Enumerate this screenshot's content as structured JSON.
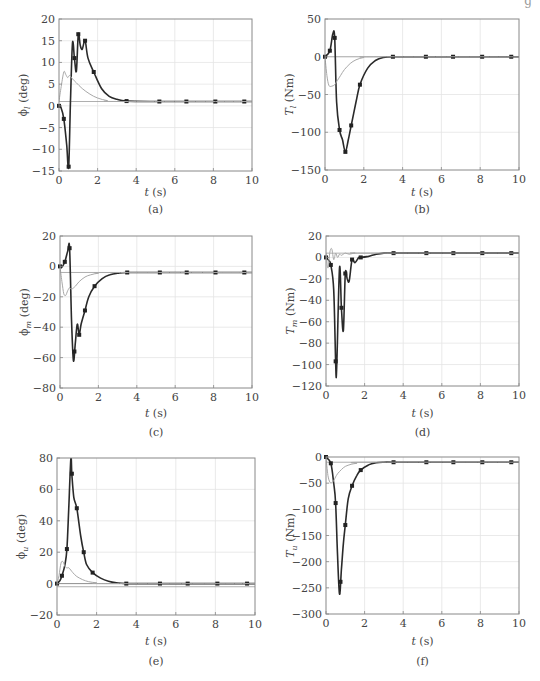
{
  "page": {
    "corner_fragment": "g"
  },
  "chart_data": [
    {
      "id": "a",
      "type": "line",
      "caption": "(a)",
      "ylabel": "ϕ_l (deg)",
      "ylabel_main": "ϕ",
      "ylabel_sub": "l",
      "ylabel_unit": "(deg)",
      "xlabel": "t (s)",
      "xlim": [
        0,
        10
      ],
      "ylim": [
        -15,
        20
      ],
      "xticks": [
        0,
        2,
        4,
        6,
        8,
        10
      ],
      "yticks": [
        -15,
        -10,
        -5,
        0,
        5,
        10,
        15,
        20
      ],
      "grid": true,
      "reference": 1,
      "series": [
        {
          "name": "thick-marked",
          "style": "thick",
          "markers": true,
          "x": [
            0,
            0.1,
            0.25,
            0.4,
            0.5,
            0.6,
            0.7,
            0.8,
            0.9,
            1.0,
            1.1,
            1.2,
            1.35,
            1.5,
            1.8,
            2.2,
            2.6,
            3.0,
            3.5,
            5.2,
            6.6,
            8.1,
            9.6,
            10
          ],
          "y": [
            0,
            -0.3,
            -3,
            -9,
            -14,
            2,
            14.5,
            11,
            8,
            16.5,
            14,
            13,
            15,
            11,
            7.8,
            4,
            2.2,
            1.5,
            1.1,
            1,
            1,
            1,
            1,
            1
          ],
          "marker_x": [
            0,
            0.25,
            0.5,
            0.8,
            1.0,
            1.35,
            1.8,
            3.5,
            5.2,
            6.6,
            8.1,
            9.6
          ]
        },
        {
          "name": "thin-gray",
          "style": "thin",
          "x": [
            0,
            0.1,
            0.25,
            0.35,
            0.45,
            0.55,
            0.7,
            0.9,
            1.2,
            1.6,
            2.0,
            2.5,
            3.0,
            10
          ],
          "y": [
            1,
            4,
            7.8,
            7.2,
            6.5,
            7,
            6.2,
            5.3,
            4,
            2.7,
            1.8,
            1.2,
            1,
            1
          ]
        }
      ]
    },
    {
      "id": "b",
      "type": "line",
      "caption": "(b)",
      "ylabel": "T_l (Nm)",
      "ylabel_main": "T",
      "ylabel_sub": "l",
      "ylabel_unit": "(Nm)",
      "xlabel": "t (s)",
      "xlim": [
        0,
        10
      ],
      "ylim": [
        -150,
        50
      ],
      "xticks": [
        0,
        2,
        4,
        6,
        8,
        10
      ],
      "yticks": [
        -150,
        -100,
        -50,
        0,
        50
      ],
      "grid": true,
      "reference": 0,
      "series": [
        {
          "name": "thick-marked",
          "style": "thick",
          "markers": true,
          "x": [
            0,
            0.25,
            0.4,
            0.5,
            0.6,
            0.75,
            0.9,
            1.05,
            1.2,
            1.35,
            1.6,
            1.8,
            2.2,
            2.6,
            3.0,
            3.5,
            5.2,
            6.6,
            8.1,
            9.6,
            10
          ],
          "y": [
            0,
            8,
            30,
            25,
            -60,
            -97,
            -110,
            -126,
            -110,
            -91,
            -60,
            -37,
            -15,
            -5,
            -1,
            0,
            0,
            0,
            0,
            0,
            0
          ],
          "marker_x": [
            0,
            0.25,
            0.5,
            0.75,
            1.05,
            1.35,
            1.8,
            3.5,
            5.2,
            6.6,
            8.1,
            9.6
          ]
        },
        {
          "name": "thin-gray",
          "style": "thin",
          "x": [
            0,
            0.1,
            0.2,
            0.35,
            0.5,
            0.6,
            0.8,
            1.0,
            1.3,
            1.6,
            2.0,
            2.5,
            10
          ],
          "y": [
            0,
            -25,
            -38,
            -39,
            -37,
            -33,
            -25,
            -17,
            -9,
            -4,
            -1,
            0,
            0
          ]
        }
      ]
    },
    {
      "id": "c",
      "type": "line",
      "caption": "(c)",
      "ylabel": "ϕ_m (deg)",
      "ylabel_main": "ϕ",
      "ylabel_sub": "m",
      "ylabel_unit": "(deg)",
      "xlabel": "t (s)",
      "xlim": [
        0,
        10
      ],
      "ylim": [
        -80,
        20
      ],
      "xticks": [
        0,
        2,
        4,
        6,
        8,
        10
      ],
      "yticks": [
        -80,
        -60,
        -40,
        -20,
        0,
        20
      ],
      "grid": true,
      "reference": -4,
      "series": [
        {
          "name": "thick-marked",
          "style": "thick",
          "markers": true,
          "x": [
            0,
            0.1,
            0.25,
            0.4,
            0.5,
            0.6,
            0.7,
            0.8,
            0.9,
            1.0,
            1.1,
            1.3,
            1.5,
            1.8,
            2.2,
            2.6,
            3.0,
            3.5,
            5.2,
            6.6,
            8.1,
            9.6,
            10
          ],
          "y": [
            0,
            -0.5,
            3,
            10,
            12,
            -35,
            -62,
            -50,
            -38,
            -45,
            -38,
            -29,
            -20,
            -13,
            -8,
            -5.5,
            -4.5,
            -4,
            -4,
            -4,
            -4,
            -4,
            -4
          ],
          "marker_x": [
            0,
            0.25,
            0.5,
            0.75,
            1.0,
            1.3,
            1.8,
            3.5,
            5.2,
            6.6,
            8.1,
            9.6
          ]
        },
        {
          "name": "thin-gray",
          "style": "thin",
          "x": [
            0,
            0.1,
            0.2,
            0.3,
            0.4,
            0.5,
            0.6,
            0.8,
            1.0,
            1.3,
            1.6,
            2.0,
            2.5,
            10
          ],
          "y": [
            0,
            -10,
            -18,
            -19,
            -16,
            -14,
            -15,
            -13,
            -10,
            -7,
            -5.5,
            -4.5,
            -4,
            -4
          ]
        }
      ]
    },
    {
      "id": "d",
      "type": "line",
      "caption": "(d)",
      "ylabel": "T_m (Nm)",
      "ylabel_main": "T",
      "ylabel_sub": "m",
      "ylabel_unit": "(Nm)",
      "xlabel": "t (s)",
      "xlim": [
        0,
        10
      ],
      "ylim": [
        -120,
        20
      ],
      "xticks": [
        0,
        2,
        4,
        6,
        8,
        10
      ],
      "yticks": [
        -120,
        -100,
        -80,
        -60,
        -40,
        -20,
        0,
        20
      ],
      "grid": true,
      "reference": 4,
      "series": [
        {
          "name": "thick-marked",
          "style": "thick",
          "markers": true,
          "x": [
            0,
            0.15,
            0.25,
            0.4,
            0.5,
            0.55,
            0.7,
            0.8,
            0.9,
            1.0,
            1.1,
            1.2,
            1.35,
            1.5,
            1.7,
            1.8,
            2.2,
            2.6,
            3.0,
            3.5,
            5.2,
            6.6,
            8.1,
            9.6,
            10
          ],
          "y": [
            0,
            -3,
            -7,
            -30,
            -97,
            -105,
            -10,
            -47,
            -68,
            -15,
            -20,
            -22,
            -2,
            -5,
            0,
            0,
            1,
            3,
            4,
            4,
            4,
            4,
            4,
            4,
            4
          ],
          "marker_x": [
            0,
            0.25,
            0.5,
            0.8,
            1.0,
            1.35,
            1.8,
            3.5,
            5.2,
            6.6,
            8.1,
            9.6
          ]
        },
        {
          "name": "thin-gray",
          "style": "thin",
          "x": [
            0,
            0.1,
            0.2,
            0.3,
            0.4,
            0.5,
            0.6,
            0.7,
            0.8,
            1.0,
            1.2,
            1.5,
            2.0,
            10
          ],
          "y": [
            4,
            -10,
            5,
            8,
            -2,
            4,
            0,
            3,
            2,
            4,
            3,
            4,
            4,
            4
          ]
        }
      ]
    },
    {
      "id": "e",
      "type": "line",
      "caption": "(e)",
      "ylabel": "ϕ_u (deg)",
      "ylabel_main": "ϕ",
      "ylabel_sub": "u",
      "ylabel_unit": "(deg)",
      "xlabel": "t (s)",
      "xlim": [
        0,
        10
      ],
      "ylim": [
        -20,
        80
      ],
      "xticks": [
        0,
        2,
        4,
        6,
        8,
        10
      ],
      "yticks": [
        -20,
        0,
        20,
        40,
        60,
        80
      ],
      "grid": true,
      "reference": -2,
      "series": [
        {
          "name": "thick-marked",
          "style": "thick",
          "markers": true,
          "x": [
            0,
            0.15,
            0.25,
            0.4,
            0.5,
            0.6,
            0.7,
            0.75,
            0.85,
            1.0,
            1.2,
            1.35,
            1.5,
            1.8,
            2.2,
            2.6,
            3.0,
            3.5,
            5.2,
            6.6,
            8.1,
            9.6,
            10
          ],
          "y": [
            0,
            2,
            5,
            12,
            22,
            50,
            80,
            70,
            55,
            48,
            30,
            20,
            12,
            7,
            3.5,
            1.5,
            0.5,
            0,
            0,
            0,
            0,
            0,
            0
          ],
          "marker_x": [
            0,
            0.25,
            0.5,
            0.75,
            1.0,
            1.35,
            1.8,
            3.5,
            5.2,
            6.6,
            8.1,
            9.6
          ]
        },
        {
          "name": "thin-gray",
          "style": "thin",
          "x": [
            0,
            0.1,
            0.2,
            0.3,
            0.4,
            0.5,
            0.6,
            0.8,
            1.0,
            1.3,
            1.6,
            2.0,
            2.5,
            10
          ],
          "y": [
            0,
            5,
            13,
            14,
            11,
            10,
            10,
            7,
            4.5,
            2.5,
            1.2,
            0.5,
            0,
            0
          ]
        }
      ]
    },
    {
      "id": "f",
      "type": "line",
      "caption": "(f)",
      "ylabel": "T_u (Nm)",
      "ylabel_main": "T",
      "ylabel_sub": "u",
      "ylabel_unit": "(Nm)",
      "xlabel": "t (s)",
      "xlim": [
        0,
        10
      ],
      "ylim": [
        -300,
        0
      ],
      "xticks": [
        0,
        2,
        4,
        6,
        8,
        10
      ],
      "yticks": [
        -300,
        -250,
        -200,
        -150,
        -100,
        -50,
        0
      ],
      "grid": true,
      "reference": -10,
      "series": [
        {
          "name": "thick-marked",
          "style": "thick",
          "markers": true,
          "x": [
            0,
            0.25,
            0.4,
            0.5,
            0.6,
            0.7,
            0.8,
            0.9,
            1.0,
            1.15,
            1.35,
            1.6,
            1.8,
            2.2,
            2.6,
            3.0,
            3.5,
            5.2,
            6.6,
            8.1,
            9.6,
            10
          ],
          "y": [
            0,
            -12,
            -50,
            -88,
            -190,
            -262,
            -215,
            -165,
            -130,
            -80,
            -55,
            -35,
            -25,
            -15,
            -11,
            -10,
            -10,
            -10,
            -10,
            -10,
            -10,
            -10
          ],
          "marker_x": [
            0,
            0.25,
            0.5,
            0.75,
            1.0,
            1.35,
            1.8,
            3.5,
            5.2,
            6.6,
            8.1,
            9.6
          ]
        },
        {
          "name": "thin-gray",
          "style": "thin",
          "x": [
            0,
            0.1,
            0.2,
            0.3,
            0.4,
            0.5,
            0.6,
            0.8,
            1.0,
            1.3,
            1.6,
            2.0,
            10
          ],
          "y": [
            0,
            -35,
            -48,
            -49,
            -45,
            -38,
            -32,
            -24,
            -18,
            -14,
            -12,
            -10,
            -10
          ]
        }
      ]
    }
  ]
}
